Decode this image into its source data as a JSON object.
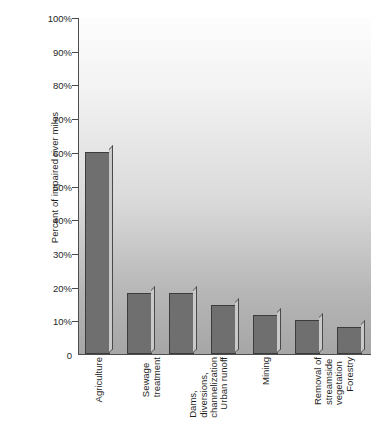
{
  "chart_data": {
    "type": "bar",
    "title": "",
    "xlabel": "",
    "ylabel": "Percent of impaired river miles",
    "ylim": [
      0,
      100
    ],
    "grid": false,
    "legend": false,
    "y_ticks": [
      "0",
      "10%",
      "20%",
      "30%",
      "40%",
      "50%",
      "60%",
      "70%",
      "80%",
      "90%",
      "100%"
    ],
    "y_tick_values": [
      0,
      10,
      20,
      30,
      40,
      50,
      60,
      70,
      80,
      90,
      100
    ],
    "categories": [
      "Agriculture",
      "Sewage\ntreatment",
      "Dams,\ndiversions,\nchannelization",
      "Urban runoff",
      "Mining",
      "Removal of\nstreamside\nvegetation",
      "Forestry"
    ],
    "values": [
      60,
      18,
      18,
      14.5,
      11.5,
      10,
      8
    ],
    "bar_color": "#6f6f6f",
    "bar_edge_color": "#3c3c3c",
    "bar_side_color": "#c9c9c9",
    "axis_color": "#4d4d4d",
    "plot_bg_top": "#fdfdfd",
    "plot_bg_bottom": "#a6a6a6"
  }
}
